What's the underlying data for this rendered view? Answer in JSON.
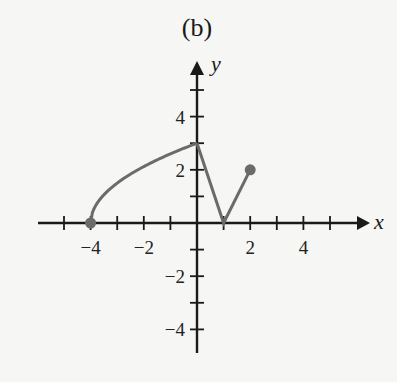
{
  "title": "(b)",
  "chart_data": {
    "type": "line",
    "title": "(b)",
    "xlabel": "x",
    "ylabel": "y",
    "xlim": [
      -6,
      6
    ],
    "ylim": [
      -5,
      6
    ],
    "grid": false,
    "x_ticks": [
      -5,
      -4,
      -3,
      -2,
      -1,
      1,
      2,
      3,
      4,
      5
    ],
    "x_tick_labels": [
      "-4",
      "-2",
      "2",
      "4"
    ],
    "x_tick_label_values": [
      -4,
      -2,
      2,
      4
    ],
    "y_ticks": [
      -4,
      -3,
      -2,
      -1,
      1,
      2,
      3,
      4,
      5
    ],
    "y_tick_labels": [
      "4",
      "2",
      "-2",
      "-4"
    ],
    "y_tick_label_values": [
      4,
      2,
      -2,
      -4
    ],
    "series": [
      {
        "name": "f",
        "color": "#6b6b6b",
        "segments": [
          {
            "kind": "curve",
            "description": "square-root arc y = 1.5*sqrt(x+4)",
            "from": [
              -4,
              0
            ],
            "to": [
              0,
              3
            ]
          },
          {
            "kind": "line",
            "points": [
              [
                0,
                3
              ],
              [
                1,
                0
              ],
              [
                2,
                2
              ]
            ]
          }
        ],
        "closed_endpoints": [
          [
            -4,
            0
          ],
          [
            2,
            2
          ]
        ]
      }
    ]
  }
}
